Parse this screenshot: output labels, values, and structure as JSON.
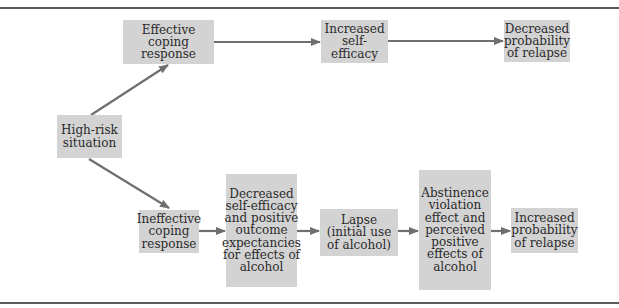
{
  "diagram": {
    "nodes": {
      "high_risk": "High-risk situation",
      "effective_coping": "Effective coping response",
      "increased_self_efficacy": "Increased self-efficacy",
      "decreased_probability": "Decreased probability of relapse",
      "ineffective_coping": "Ineffective coping response",
      "decreased_self_efficacy": "Decreased self-efficacy and positive outcome expectancies for effects of alcohol",
      "lapse": "Lapse (initial use of alcohol)",
      "abstinence_violation": "Abstinence violation effect and perceived positive effects of alcohol",
      "increased_probability": "Increased probability of relapse"
    },
    "edges": [
      [
        "high_risk",
        "effective_coping"
      ],
      [
        "effective_coping",
        "increased_self_efficacy"
      ],
      [
        "increased_self_efficacy",
        "decreased_probability"
      ],
      [
        "high_risk",
        "ineffective_coping"
      ],
      [
        "ineffective_coping",
        "decreased_self_efficacy"
      ],
      [
        "decreased_self_efficacy",
        "lapse"
      ],
      [
        "lapse",
        "abstinence_violation"
      ],
      [
        "abstinence_violation",
        "increased_probability"
      ]
    ],
    "colors": {
      "box": "#d3d3d3",
      "arrow": "#6f6f6f",
      "rule": "#5a5a5a"
    }
  }
}
